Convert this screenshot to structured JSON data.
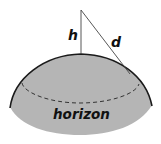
{
  "diagram": {
    "labels": {
      "height": "h",
      "distance": "d",
      "horizon": "horizon"
    },
    "colors": {
      "surface_fill": "#b5b5b5",
      "outline": "#1a1a1a",
      "line": "#444444",
      "background": "#ffffff"
    }
  }
}
